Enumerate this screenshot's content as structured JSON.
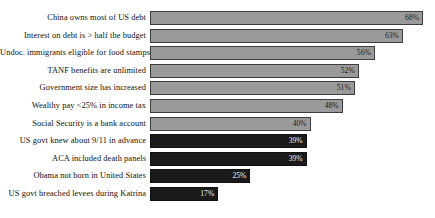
{
  "chart_data": {
    "type": "bar",
    "orientation": "horizontal",
    "title": "",
    "subtitle": "",
    "xlabel": "",
    "ylabel": "",
    "xlim": [
      0,
      71
    ],
    "grid": false,
    "legend": false,
    "value_suffix": "%",
    "categories": [
      "China owns most of US debt",
      "Interest on debt is > half the budget",
      "Undoc. immigrants eligible for food stamps",
      "TANF benefits are unlimited",
      "Government size has increased",
      "Wealthy pay <25% in income tax",
      "Social Security is a bank account",
      "US govt knew about 9/11 in advance",
      "ACA included death panels",
      "Obama not born in United States",
      "US govt breached levees during Katrina"
    ],
    "values": [
      68,
      63,
      56,
      52,
      51,
      48,
      40,
      39,
      39,
      25,
      17
    ],
    "value_labels": [
      "68%",
      "63%",
      "56%",
      "52%",
      "51%",
      "48%",
      "40%",
      "39%",
      "39%",
      "25%",
      "17%"
    ],
    "bar_styles": [
      "light",
      "light",
      "light",
      "light",
      "light",
      "light",
      "light",
      "dark",
      "dark",
      "dark",
      "dark"
    ],
    "colors": {
      "light_fill": "#9a9a9a",
      "light_border": "#3d3d3d",
      "dark_fill": "#1a1a1a",
      "dark_border": "#111111",
      "background": "#ffffff",
      "label_text": "#101010",
      "value_text_on_light": "#1b1b1b",
      "value_text_on_dark": "#f2f2f2"
    }
  }
}
